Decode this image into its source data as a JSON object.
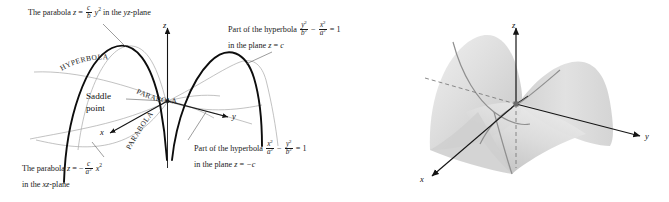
{
  "figure": {
    "kind": "saddle-surface-hyperbolic-paraboloid-diagram",
    "background_color": "#ffffff",
    "ink_color": "#1a1a1a",
    "accent_gray": "#9a9a9a",
    "surface_fill_light": "#e3e3e3",
    "surface_fill_dark": "#bfbfbf"
  },
  "left_panel": {
    "annotations": {
      "top_left": {
        "line1_prefix": "The parabola",
        "line1_var_z": "z",
        "equals": "=",
        "frac_num": "c",
        "frac_den": "b",
        "frac_den_sup": "2",
        "var_y": "y",
        "y_sup": "2",
        "line1_suffix": "in the",
        "plane_name": "yz",
        "plane_word": "-plane"
      },
      "top_right": {
        "line1_prefix": "Part of the hyperbola",
        "frac1_num": "y",
        "frac1_num_sup": "2",
        "frac1_den": "b",
        "frac1_den_sup": "2",
        "minus": "−",
        "frac2_num": "x",
        "frac2_num_sup": "2",
        "frac2_den": "a",
        "frac2_den_sup": "2",
        "equals_one": "= 1",
        "line2_prefix": "in the plane",
        "line2_var": "z",
        "line2_equals": "=",
        "line2_value": "c"
      },
      "bottom_right": {
        "line1_prefix": "Part of the hyperbola",
        "frac1_num": "x",
        "frac1_num_sup": "2",
        "frac1_den": "a",
        "frac1_den_sup": "2",
        "minus": "−",
        "frac2_num": "y",
        "frac2_num_sup": "2",
        "frac2_den": "b",
        "frac2_den_sup": "2",
        "equals_one": "= 1",
        "line2_prefix": "in the plane",
        "line2_var": "z",
        "line2_equals": "=",
        "line2_value": "−c"
      },
      "bottom_left": {
        "line1_prefix": "The parabola",
        "line1_var_z": "z",
        "equals": "=",
        "neg": "−",
        "frac_num": "c",
        "frac_den": "a",
        "frac_den_sup": "2",
        "var_x": "x",
        "x_sup": "2",
        "line2": "in the",
        "plane_name": "xz",
        "plane_word": "-plane"
      }
    },
    "curve_labels": {
      "hyperbola": "HYPERBOLA",
      "parabola_upper": "PARABOLA",
      "parabola_lower": "PARABOLA"
    },
    "saddle_point": {
      "line1": "Saddle",
      "line2": "point"
    },
    "axes": {
      "z": "z",
      "y": "y",
      "x": "x"
    }
  },
  "right_panel": {
    "axes": {
      "z": "z",
      "y": "y",
      "x": "x"
    },
    "surface_description": "shaded hyperbolic paraboloid saddle surface"
  }
}
